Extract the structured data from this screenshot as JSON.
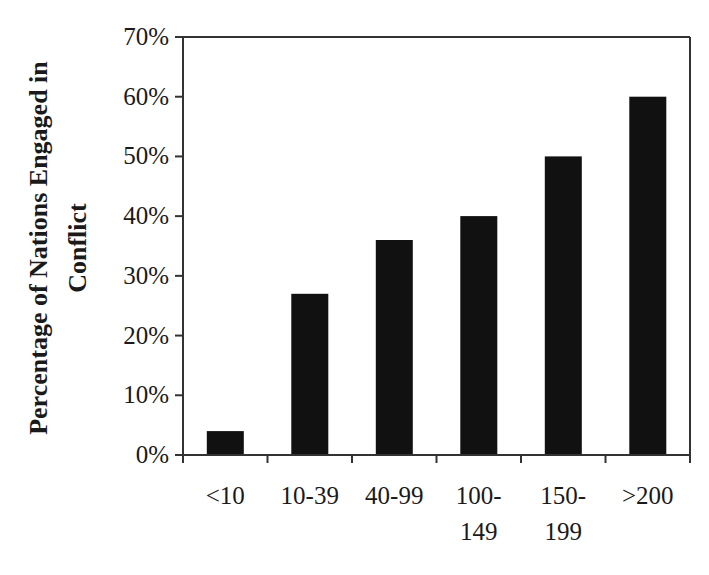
{
  "chart_data": {
    "type": "bar",
    "title": "",
    "xlabel": "",
    "ylabel": "Percentage of Nations Engaged in Conflict",
    "ylabel_lines": [
      "Percentage of Nations Engaged in",
      "Conflict"
    ],
    "categories": [
      "<10",
      "10-39",
      "40-99",
      "100-149",
      "150-199",
      ">200"
    ],
    "category_display": [
      "<10",
      "10-39",
      "40-99",
      "100-\n149",
      "150-\n199",
      ">200"
    ],
    "values": [
      4,
      27,
      36,
      40,
      50,
      60
    ],
    "value_unit": "%",
    "ylim": [
      0,
      70
    ],
    "yticks": [
      0,
      10,
      20,
      30,
      40,
      50,
      60,
      70
    ],
    "ytick_labels": [
      "0%",
      "10%",
      "20%",
      "30%",
      "40%",
      "50%",
      "60%",
      "70%"
    ],
    "grid": false,
    "legend": null,
    "bar_color": "#111111",
    "frame": "box"
  }
}
